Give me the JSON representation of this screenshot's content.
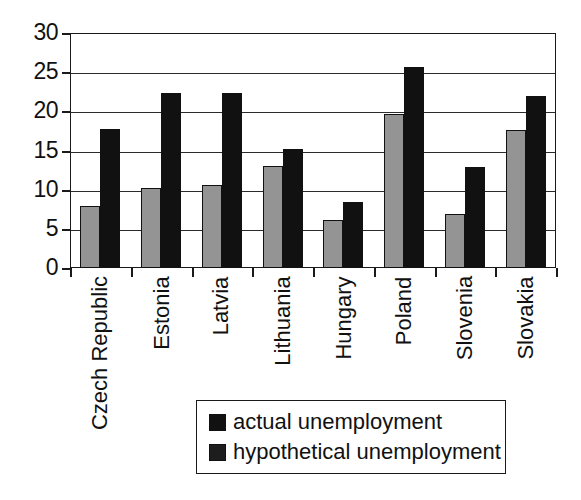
{
  "chart_data": {
    "type": "bar",
    "title": "",
    "subtitle": "",
    "xlabel": "",
    "ylabel": "",
    "ylim": [
      0,
      30
    ],
    "yticks": [
      0,
      5,
      10,
      15,
      20,
      25,
      30
    ],
    "ytick_labels": [
      "0",
      "5",
      "10",
      "15",
      "20",
      "25",
      "30"
    ],
    "grid": true,
    "legend_position": "bottom-center",
    "categories": [
      "Czech Republic",
      "Estonia",
      "Latvia",
      "Lithuania",
      "Hungary",
      "Poland",
      "Slovenia",
      "Slovakia"
    ],
    "series": [
      {
        "name": "actual unemployment",
        "color": "#949494",
        "values": [
          7.9,
          10.2,
          10.6,
          13.0,
          6.1,
          19.6,
          6.9,
          17.6
        ]
      },
      {
        "name": "hypothetical unemployment",
        "color": "#111111",
        "values": [
          17.7,
          22.4,
          22.4,
          15.2,
          8.4,
          25.7,
          12.9,
          22.0
        ]
      }
    ]
  },
  "legend": {
    "entries": [
      {
        "label": "actual unemployment",
        "swatch": "legend-swatch-actual"
      },
      {
        "label": "hypothetical unemployment",
        "swatch": "legend-swatch-hypothetical"
      }
    ]
  },
  "colors": {
    "actual": "#949494",
    "hypothetical": "#111111",
    "axis": "#1a1a1a",
    "grid": "#2b2b2b",
    "background": "#ffffff"
  }
}
